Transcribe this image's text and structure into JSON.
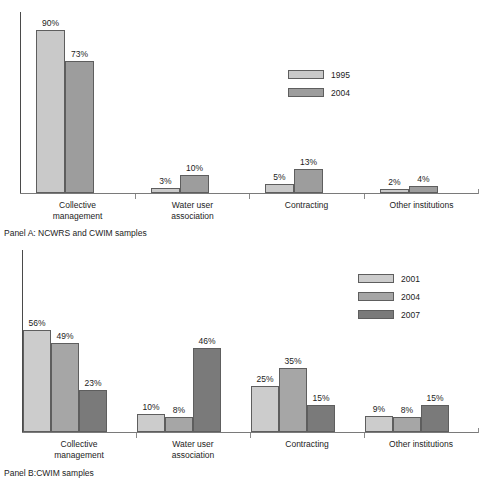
{
  "chart_data": [
    {
      "panel_id": "A",
      "type": "bar",
      "title": "",
      "caption": "Panel A: NCWRS and CWIM samples",
      "categories": [
        "Collective\nmanagement",
        "Water user\nassociation",
        "Contracting",
        "Other institutions"
      ],
      "series": [
        {
          "name": "1995",
          "values": [
            90,
            3,
            5,
            2
          ],
          "color": "#c9c9c9"
        },
        {
          "name": "2004",
          "values": [
            73,
            10,
            13,
            4
          ],
          "color": "#9d9d9d"
        }
      ],
      "value_labels": [
        [
          "90%",
          "3%",
          "5%",
          "2%"
        ],
        [
          "73%",
          "10%",
          "13%",
          "4%"
        ]
      ],
      "xlabel": "",
      "ylabel": "",
      "ylim": [
        0,
        100
      ],
      "grid": false,
      "legend_position": "center-top"
    },
    {
      "panel_id": "B",
      "type": "bar",
      "title": "",
      "caption": "Panel B:CWIM samples",
      "categories": [
        "Collective\nmanagement",
        "Water user\nassociation",
        "Contracting",
        "Other institutions"
      ],
      "series": [
        {
          "name": "2001",
          "values": [
            56,
            10,
            25,
            9
          ],
          "color": "#cccccc"
        },
        {
          "name": "2004",
          "values": [
            49,
            8,
            35,
            8
          ],
          "color": "#a6a6a6"
        },
        {
          "name": "2007",
          "values": [
            23,
            46,
            15,
            15
          ],
          "color": "#7a7a7a"
        }
      ],
      "value_labels": [
        [
          "56%",
          "10%",
          "25%",
          "9%"
        ],
        [
          "49%",
          "8%",
          "35%",
          "8%"
        ],
        [
          "23%",
          "46%",
          "15%",
          "15%"
        ]
      ],
      "xlabel": "",
      "ylabel": "",
      "ylim": [
        0,
        100
      ],
      "grid": false,
      "legend_position": "right-top"
    }
  ],
  "panel_a": {
    "caption": "Panel A: NCWRS and CWIM samples",
    "legend": [
      {
        "label": "1995",
        "color": "#c9c9c9"
      },
      {
        "label": "2004",
        "color": "#9d9d9d"
      }
    ],
    "categories": [
      {
        "label": "Collective\nmanagement"
      },
      {
        "label": "Water user\nassociation"
      },
      {
        "label": "Contracting"
      },
      {
        "label": "Other institutions"
      }
    ],
    "bars": [
      {
        "label": "90%",
        "value": 90,
        "series": "1995"
      },
      {
        "label": "73%",
        "value": 73,
        "series": "2004"
      },
      {
        "label": "3%",
        "value": 3,
        "series": "1995"
      },
      {
        "label": "10%",
        "value": 10,
        "series": "2004"
      },
      {
        "label": "5%",
        "value": 5,
        "series": "1995"
      },
      {
        "label": "13%",
        "value": 13,
        "series": "2004"
      },
      {
        "label": "2%",
        "value": 2,
        "series": "1995"
      },
      {
        "label": "4%",
        "value": 4,
        "series": "2004"
      }
    ]
  },
  "panel_b": {
    "caption": "Panel B:CWIM samples",
    "legend": [
      {
        "label": "2001",
        "color": "#cccccc"
      },
      {
        "label": "2004",
        "color": "#a6a6a6"
      },
      {
        "label": "2007",
        "color": "#7a7a7a"
      }
    ],
    "categories": [
      {
        "label": "Collective\nmanagement"
      },
      {
        "label": "Water user\nassociation"
      },
      {
        "label": "Contracting"
      },
      {
        "label": "Other institutions"
      }
    ],
    "bars": [
      {
        "label": "56%",
        "value": 56,
        "series": "2001"
      },
      {
        "label": "49%",
        "value": 49,
        "series": "2004"
      },
      {
        "label": "23%",
        "value": 23,
        "series": "2007"
      },
      {
        "label": "10%",
        "value": 10,
        "series": "2001"
      },
      {
        "label": "8%",
        "value": 8,
        "series": "2004"
      },
      {
        "label": "46%",
        "value": 46,
        "series": "2007"
      },
      {
        "label": "25%",
        "value": 25,
        "series": "2001"
      },
      {
        "label": "35%",
        "value": 35,
        "series": "2004"
      },
      {
        "label": "15%",
        "value": 15,
        "series": "2007"
      },
      {
        "label": "9%",
        "value": 9,
        "series": "2001"
      },
      {
        "label": "8%",
        "value": 8,
        "series": "2004"
      },
      {
        "label": "15%",
        "value": 15,
        "series": "2007"
      }
    ]
  }
}
